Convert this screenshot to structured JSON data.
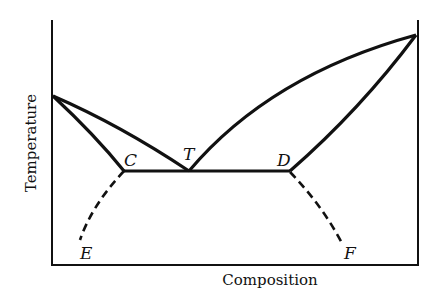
{
  "diagram": {
    "type": "phase-diagram",
    "axes": {
      "x_label": "Composition",
      "y_label": "Temperature"
    },
    "points": {
      "C": "C",
      "T": "T",
      "D": "D",
      "E": "E",
      "F": "F"
    },
    "colors": {
      "line": "#111111",
      "background": "#ffffff"
    }
  }
}
